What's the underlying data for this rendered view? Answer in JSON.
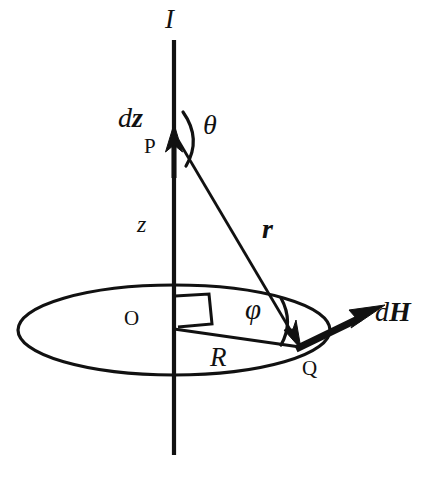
{
  "figure": {
    "background_color": "#ffffff",
    "stroke_color": "#111111",
    "width": 425,
    "height": 480,
    "caption": ""
  },
  "labels": {
    "current": "I",
    "element_d": "d",
    "element_z": "z",
    "point_p": "P",
    "angle_theta": "θ",
    "height_z": "z",
    "distance_r": "r",
    "origin_o": "O",
    "radius_r": "R",
    "angle_phi": "φ",
    "point_q": "Q",
    "field_d": "d",
    "field_h": "H"
  },
  "geometry": {
    "axis": {
      "x": 174,
      "y_top": 40,
      "y_bottom": 455
    },
    "point_p": {
      "x": 174,
      "y": 140
    },
    "point_o": {
      "x": 174,
      "y": 330
    },
    "point_q": {
      "x": 300,
      "y": 347
    },
    "ellipse": {
      "cx": 174,
      "cy": 330,
      "rx": 156,
      "ry": 45
    },
    "dz_arrow": {
      "tip_x": 174,
      "tip_y": 126,
      "tail_y": 175
    },
    "dh_arrow": {
      "from_x": 300,
      "from_y": 347,
      "to_x": 383,
      "to_y": 305
    }
  }
}
